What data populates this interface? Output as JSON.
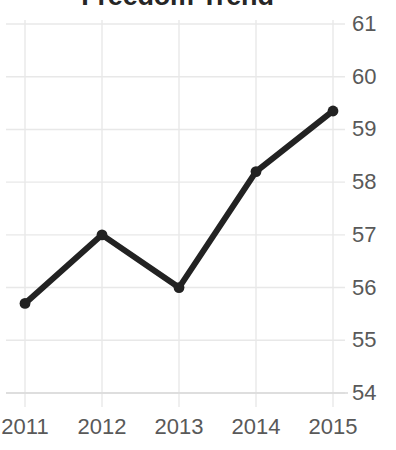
{
  "chart_data": {
    "type": "line",
    "title": "Freedom Trend",
    "xlabel": "",
    "ylabel": "",
    "categories": [
      "2011",
      "2012",
      "2013",
      "2014",
      "2015"
    ],
    "x": [
      2011,
      2012,
      2013,
      2014,
      2015
    ],
    "values": [
      55.7,
      57.0,
      56.0,
      58.2,
      59.35
    ],
    "series": [
      {
        "name": "Freedom Trend",
        "values": [
          55.7,
          57.0,
          56.0,
          58.2,
          59.35
        ]
      }
    ],
    "ylim": [
      54,
      61
    ],
    "yticks": [
      61,
      60,
      59,
      58,
      57,
      56,
      55,
      54
    ],
    "ytick_labels": [
      "61",
      "60",
      "59",
      "58",
      "57",
      "56",
      "55",
      "54"
    ],
    "xtick_labels": [
      "2011",
      "2012",
      "2013",
      "2014",
      "2015"
    ],
    "y_axis_position": "right",
    "grid": true,
    "grid_axes": "both",
    "legend": false,
    "legend_position": "none",
    "marker": "circle",
    "colors": {
      "line": "#222222",
      "marker": "#222222",
      "grid": "#e8e8e8",
      "axis": "#d9d9d9",
      "tick_label": "#595959",
      "title": "#262626",
      "background": "#ffffff"
    },
    "annotations": []
  }
}
